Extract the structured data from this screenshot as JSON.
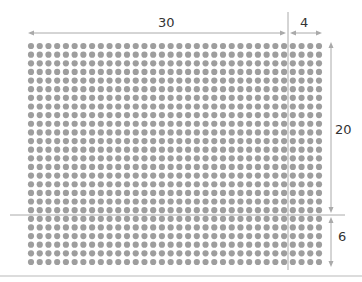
{
  "diagram": {
    "type": "dot-grid-dimension-diagram",
    "grid": {
      "columns": 34,
      "rows": 26,
      "dot_color": "#9e9e9e"
    },
    "dimensions": {
      "top_left_width": "30",
      "top_right_width": "4",
      "right_upper_height": "20",
      "right_lower_height": "6"
    },
    "line_color": "#aaaaaa"
  }
}
